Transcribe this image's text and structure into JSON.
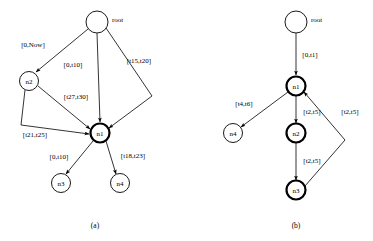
{
  "figure": {
    "background_color": "#ffffff",
    "stroke_color": "#000000",
    "panels": [
      {
        "id": "a",
        "caption": "(a)",
        "nodes": [
          {
            "id": "root",
            "label": "root",
            "label_position": "outside-right",
            "style": "thin",
            "cx": 97,
            "cy": 22,
            "r": 11
          },
          {
            "id": "n2",
            "label": "n2",
            "label_position": "inside",
            "style": "thin",
            "cx": 29,
            "cy": 81,
            "r": 9.5
          },
          {
            "id": "n1",
            "label": "n1",
            "label_position": "inside",
            "style": "bold",
            "cx": 100,
            "cy": 133,
            "r": 9.5
          },
          {
            "id": "n3",
            "label": "n3",
            "label_position": "inside",
            "style": "thin",
            "cx": 61,
            "cy": 183,
            "r": 9.5
          },
          {
            "id": "n4",
            "label": "n4",
            "label_position": "inside",
            "style": "thin",
            "cx": 120,
            "cy": 183,
            "r": 9.5
          }
        ],
        "edges": [
          {
            "from": "root",
            "to": "n2",
            "label": "[0,Now]"
          },
          {
            "from": "root",
            "to": "n1",
            "label": "[0,t10]"
          },
          {
            "from": "root",
            "to": "n1",
            "label": "[t15,t20]",
            "routing": "bend-right"
          },
          {
            "from": "n2",
            "to": "n1",
            "label": "[t27,t30]"
          },
          {
            "from": "n2",
            "to": "n1",
            "label": "[t21,t25]",
            "routing": "bend-left"
          },
          {
            "from": "n1",
            "to": "n3",
            "label": "[0,t10]"
          },
          {
            "from": "n1",
            "to": "n4",
            "label": "[t18,t23]"
          }
        ]
      },
      {
        "id": "b",
        "caption": "(b)",
        "nodes": [
          {
            "id": "root",
            "label": "root",
            "label_position": "outside-right",
            "style": "thin",
            "cx": 111,
            "cy": 22,
            "r": 11
          },
          {
            "id": "n1",
            "label": "n1",
            "label_position": "inside",
            "style": "bold",
            "cx": 111,
            "cy": 86,
            "r": 9.5
          },
          {
            "id": "n4",
            "label": "n4",
            "label_position": "inside",
            "style": "thin",
            "cx": 48,
            "cy": 133,
            "r": 9.5
          },
          {
            "id": "n2",
            "label": "n2",
            "label_position": "inside",
            "style": "bold",
            "cx": 111,
            "cy": 133,
            "r": 9.5
          },
          {
            "id": "n3",
            "label": "n3",
            "label_position": "inside",
            "style": "bold",
            "cx": 111,
            "cy": 190,
            "r": 9.5
          }
        ],
        "edges": [
          {
            "from": "root",
            "to": "n1",
            "label": "[0,t1]"
          },
          {
            "from": "n1",
            "to": "n4",
            "label": "[t4,t6]"
          },
          {
            "from": "n1",
            "to": "n2",
            "label": "[t2,t5]"
          },
          {
            "from": "n2",
            "to": "n3",
            "label": "[t2,t5]"
          },
          {
            "from": "n3",
            "to": "n1",
            "label": "[t2,t5]",
            "routing": "bend-right"
          }
        ]
      }
    ]
  }
}
